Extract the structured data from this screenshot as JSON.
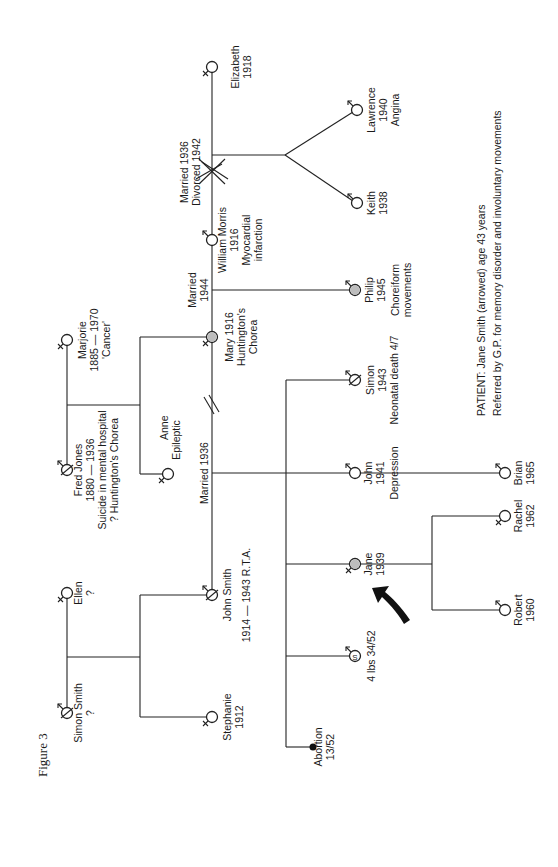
{
  "figure": {
    "caption": "Figure 3"
  },
  "patient_note": {
    "line1": "PATIENT:  Jane Smith (arrowed) age 43 years",
    "line2": "Referred by G.P. for memory disorder and involuntary movements"
  },
  "generation1": {
    "simon_smith": {
      "name": "Simon Smith",
      "dates": "?",
      "sex": "male",
      "status": "deceased"
    },
    "ellen": {
      "name": "Ellen",
      "dates": "?",
      "sex": "female"
    },
    "fred_jones": {
      "name": "Fred Jones",
      "dates": "1880 — 1936",
      "note1": "Suicide in mental hospital",
      "note2": "? Huntington's Chorea",
      "sex": "male",
      "status": "deceased"
    },
    "marjorie": {
      "name": "Marjorie",
      "dates": "1885 — 1970",
      "note": "'Cancer'",
      "sex": "female"
    }
  },
  "generation2": {
    "stephanie": {
      "name": "Stephanie",
      "dates": "1912",
      "sex": "female"
    },
    "john_smith": {
      "name": "John Smith",
      "dates": "1914 — 1943 R.T.A.",
      "sex": "male",
      "status": "deceased"
    },
    "anne": {
      "name": "Anne",
      "note": "Epileptic",
      "sex": "female"
    },
    "mary": {
      "name": "Mary 1916",
      "note1": "Huntington's",
      "note2": "Chorea",
      "sex": "female",
      "affected": true
    },
    "william_morris": {
      "name": "William Morris",
      "dates": "1916",
      "note1": "Myocardial",
      "note2": "infarction",
      "sex": "male"
    },
    "elizabeth": {
      "name": "Elizabeth",
      "dates": "1918",
      "sex": "female"
    }
  },
  "marriages": {
    "smith_mary": "Married 1936",
    "mary_morris_l1": "Married",
    "mary_morris_l2": "1944",
    "morris_elizabeth_l1": "Married 1936",
    "morris_elizabeth_l2": "Divorced 1942"
  },
  "generation3": {
    "abortion": {
      "name": "Abortion",
      "dates": "13/52"
    },
    "stillbirth": {
      "label": "4 lbs 34/52",
      "symbol_letter": "S",
      "sex": "male"
    },
    "jane": {
      "name": "Jane",
      "dates": "1939",
      "sex": "female",
      "affected": true,
      "proband": true
    },
    "john": {
      "name": "John",
      "dates": "1941",
      "note": "Depression",
      "sex": "male"
    },
    "simon": {
      "name": "Simon",
      "dates": "1943",
      "note": "Neonatal death 4/7",
      "sex": "male",
      "status": "deceased"
    },
    "philip": {
      "name": "Philip",
      "dates": "1945",
      "note1": "Choreiform",
      "note2": "movements",
      "sex": "male",
      "affected": true
    },
    "keith": {
      "name": "Keith",
      "dates": "1938",
      "sex": "male"
    },
    "lawrence": {
      "name": "Lawrence",
      "dates": "1940",
      "note": "Angina",
      "sex": "male"
    }
  },
  "generation4": {
    "robert": {
      "name": "Robert",
      "dates": "1960",
      "sex": "male"
    },
    "rachel": {
      "name": "Rachel",
      "dates": "1962",
      "sex": "female"
    },
    "brian": {
      "name": "Brian",
      "dates": "1965",
      "sex": "male"
    }
  },
  "colors": {
    "line": "#222222",
    "affected_fill": "#bdbdbd",
    "background": "#ffffff"
  }
}
